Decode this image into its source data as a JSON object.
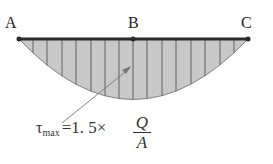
{
  "diagram": {
    "points": [
      {
        "id": "A",
        "label": "A"
      },
      {
        "id": "B",
        "label": "B"
      },
      {
        "id": "C",
        "label": "C"
      }
    ],
    "formula": {
      "symbol": "τ",
      "subscript": "max",
      "equals": "=",
      "coefficient": "1. 5",
      "times": "×",
      "numerator": "Q",
      "denominator": "A"
    },
    "colors": {
      "beam": "#2a2a2a",
      "fill": "#c8c8c8",
      "hatch": "#555555",
      "arrow": "#777777"
    }
  }
}
